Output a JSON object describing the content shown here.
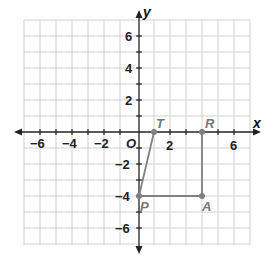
{
  "diagram": {
    "type": "coordinate-plane",
    "x_axis_label": "x",
    "y_axis_label": "y",
    "origin_label": "O",
    "range": {
      "xmin": -7,
      "xmax": 7,
      "ymin": -7,
      "ymax": 7
    },
    "x_tick_labels": [
      "−6",
      "−4",
      "−2",
      "2",
      "6"
    ],
    "y_tick_labels": [
      "6",
      "4",
      "2",
      "−2",
      "−4",
      "−6"
    ],
    "points": [
      {
        "name": "T",
        "x": 1,
        "y": 0
      },
      {
        "name": "R",
        "x": 4,
        "y": 0
      },
      {
        "name": "A",
        "x": 4,
        "y": -4
      },
      {
        "name": "P",
        "x": 0,
        "y": -4
      }
    ],
    "segments": [
      [
        "T",
        "P"
      ],
      [
        "P",
        "A"
      ],
      [
        "A",
        "R"
      ]
    ],
    "colors": {
      "grid": "#d0d0d0",
      "axis": "#222222",
      "figure": "#808080"
    }
  }
}
